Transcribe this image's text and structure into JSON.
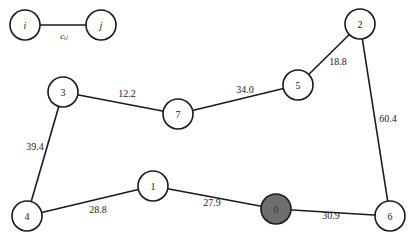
{
  "legend": {
    "node_i": "i",
    "node_j": "j",
    "edge_label": "cᵢⱼ"
  },
  "nodes": [
    {
      "id": "0",
      "label": "0",
      "x": 276,
      "y": 209,
      "depot": true
    },
    {
      "id": "1",
      "label": "1",
      "x": 153,
      "y": 186,
      "depot": false
    },
    {
      "id": "2",
      "label": "2",
      "x": 360,
      "y": 24,
      "depot": false
    },
    {
      "id": "3",
      "label": "3",
      "x": 63,
      "y": 92,
      "depot": false
    },
    {
      "id": "4",
      "label": "4",
      "x": 27,
      "y": 216,
      "depot": false
    },
    {
      "id": "5",
      "label": "5",
      "x": 298,
      "y": 85,
      "depot": false
    },
    {
      "id": "6",
      "label": "6",
      "x": 390,
      "y": 216,
      "depot": false
    },
    {
      "id": "7",
      "label": "7",
      "x": 178,
      "y": 114,
      "depot": false
    }
  ],
  "edges": [
    {
      "from": "3",
      "to": "7",
      "cost": "12.2"
    },
    {
      "from": "7",
      "to": "5",
      "cost": "34.0"
    },
    {
      "from": "5",
      "to": "2",
      "cost": "18.8"
    },
    {
      "from": "2",
      "to": "6",
      "cost": "60.4"
    },
    {
      "from": "6",
      "to": "0",
      "cost": "30.9"
    },
    {
      "from": "0",
      "to": "1",
      "cost": "27.9"
    },
    {
      "from": "1",
      "to": "4",
      "cost": "28.8"
    },
    {
      "from": "4",
      "to": "3",
      "cost": "39.4"
    }
  ],
  "colors": {
    "depot_fill": "#6e6e6e",
    "stroke": "#1a1a1a"
  }
}
